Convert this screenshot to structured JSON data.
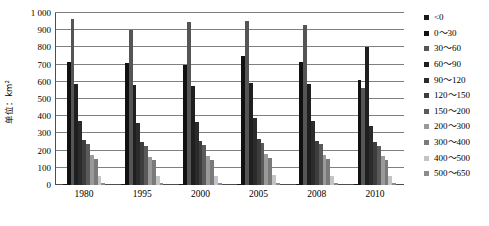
{
  "chart_data": {
    "type": "bar",
    "title": "",
    "subtitle": "",
    "xlabel": "",
    "ylabel": "单位：km²",
    "ylim": [
      0,
      1000
    ],
    "ytick_labels": [
      "1 000",
      "900",
      "800",
      "700",
      "600",
      "500",
      "400",
      "300",
      "200",
      "100",
      "0"
    ],
    "ytick_values": [
      1000,
      900,
      800,
      700,
      600,
      500,
      400,
      300,
      200,
      100,
      0
    ],
    "grid": true,
    "legend_position": "right",
    "categories": [
      "1980",
      "1995",
      "2000",
      "2005",
      "2008",
      "2010"
    ],
    "series": [
      {
        "name": "<0",
        "color": "#1a1a1a",
        "values": [
          8,
          6,
          7,
          7,
          6,
          5
        ]
      },
      {
        "name": "0~30",
        "color": "#111111",
        "values": [
          715,
          712,
          700,
          752,
          718,
          612
        ]
      },
      {
        "name": "30~60",
        "color": "#555555",
        "values": [
          968,
          903,
          950,
          952,
          932,
          565
        ]
      },
      {
        "name": "60~90",
        "color": "#1f1f1f",
        "values": [
          588,
          580,
          578,
          592,
          585,
          805
        ]
      },
      {
        "name": "90~120",
        "color": "#2b2b2b",
        "values": [
          370,
          362,
          365,
          390,
          372,
          345
        ]
      },
      {
        "name": "120~150",
        "color": "#3d3d3d",
        "values": [
          262,
          252,
          255,
          270,
          258,
          252
        ]
      },
      {
        "name": "150~200",
        "color": "#5a5a5a",
        "values": [
          238,
          228,
          230,
          246,
          236,
          228
        ]
      },
      {
        "name": "200~300",
        "color": "#9a9a9a",
        "values": [
          175,
          165,
          168,
          182,
          172,
          168
        ]
      },
      {
        "name": "300~400",
        "color": "#7a7a7a",
        "values": [
          152,
          145,
          147,
          158,
          150,
          146
        ]
      },
      {
        "name": "400~500",
        "color": "#c4c4c4",
        "values": [
          55,
          50,
          52,
          58,
          54,
          50
        ]
      },
      {
        "name": "500~650",
        "color": "#8c8c8c",
        "values": [
          12,
          10,
          10,
          12,
          11,
          10
        ]
      }
    ]
  },
  "legend": {
    "items": [
      {
        "label": "<0"
      },
      {
        "label": "0～30"
      },
      {
        "label": "30～60"
      },
      {
        "label": "60～90"
      },
      {
        "label": "90～120"
      },
      {
        "label": "120～150"
      },
      {
        "label": "150～200"
      },
      {
        "label": "200～300"
      },
      {
        "label": "300～400"
      },
      {
        "label": "400～500"
      },
      {
        "label": "500～650"
      }
    ]
  }
}
